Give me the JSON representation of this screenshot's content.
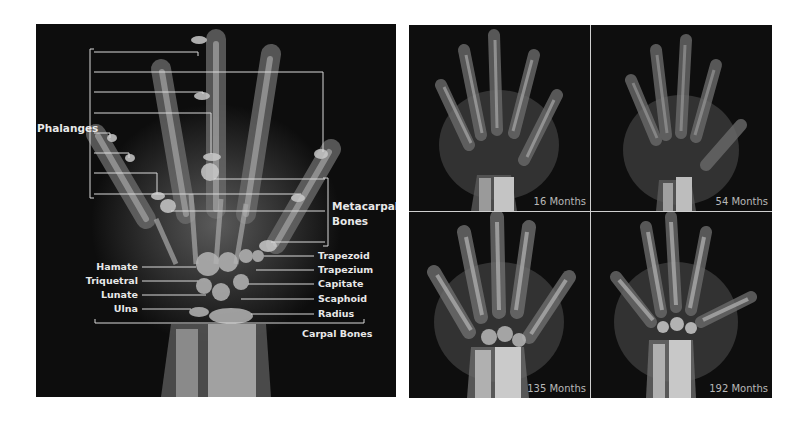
{
  "figure": {
    "left_panel": {
      "description": "Annotated hand X-ray",
      "group_labels": {
        "phalanges": "Phalanges",
        "metacarpal_line1": "Metacarpal",
        "metacarpal_line2": "Bones",
        "carpal": "Carpal Bones"
      },
      "left_labels": [
        "Hamate",
        "Triquetral",
        "Lunate",
        "Ulna"
      ],
      "right_labels": [
        "Trapezoid",
        "Trapezium",
        "Capitate",
        "Scaphoid",
        "Radius"
      ]
    },
    "right_panel": {
      "description": "Hand X-rays at different ages",
      "quadrants": [
        {
          "position": "top-left",
          "age_label": "16 Months"
        },
        {
          "position": "top-right",
          "age_label": "54 Months"
        },
        {
          "position": "bottom-left",
          "age_label": "135 Months"
        },
        {
          "position": "bottom-right",
          "age_label": "192 Months"
        }
      ]
    },
    "colors": {
      "background": "#ffffff",
      "xray_background": "#0d0d0d",
      "annotation_line": "#d9d9d9",
      "label_text": "#e8e8e8",
      "age_text": "#b8b8b8"
    }
  }
}
